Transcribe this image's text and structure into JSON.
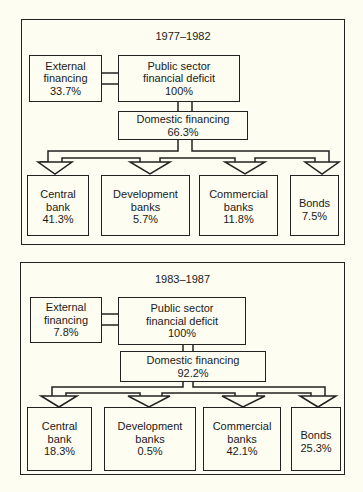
{
  "figure": {
    "panels": [
      {
        "period": "1977–1982",
        "external_financing": {
          "label_line1": "External",
          "label_line2": "financing",
          "value": "33.7%"
        },
        "public_sector_deficit": {
          "label_line1": "Public sector",
          "label_line2": "financial deficit",
          "value": "100%"
        },
        "domestic_financing": {
          "label": "Domestic financing",
          "value": "66.3%"
        },
        "sources": [
          {
            "label_line1": "Central",
            "label_line2": "bank",
            "value": "41.3%"
          },
          {
            "label_line1": "Development",
            "label_line2": "banks",
            "value": "5.7%"
          },
          {
            "label_line1": "Commercial",
            "label_line2": "banks",
            "value": "11.8%"
          },
          {
            "label_line1": "Bonds",
            "label_line2": "",
            "value": "7.5%"
          }
        ]
      },
      {
        "period": "1983–1987",
        "external_financing": {
          "label_line1": "External",
          "label_line2": "financing",
          "value": "7.8%"
        },
        "public_sector_deficit": {
          "label_line1": "Public sector",
          "label_line2": "financial deficit",
          "value": "100%"
        },
        "domestic_financing": {
          "label": "Domestic financing",
          "value": "92.2%"
        },
        "sources": [
          {
            "label_line1": "Central",
            "label_line2": "bank",
            "value": "18.3%"
          },
          {
            "label_line1": "Development",
            "label_line2": "banks",
            "value": "0.5%"
          },
          {
            "label_line1": "Commercial",
            "label_line2": "banks",
            "value": "42.1%"
          },
          {
            "label_line1": "Bonds",
            "label_line2": "",
            "value": "25.3%"
          }
        ]
      }
    ]
  }
}
